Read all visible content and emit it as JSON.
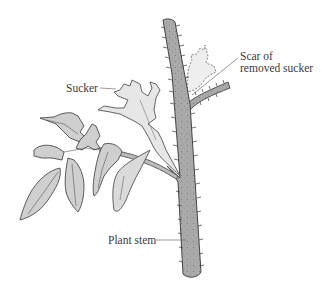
{
  "diagram": {
    "labels": {
      "scar_line1": "Scar of",
      "scar_line2": "removed sucker",
      "sucker": "Sucker",
      "plant_stem": "Plant stem"
    },
    "colors": {
      "stem_fill": "#a9a9a9",
      "leaf_fill": "#cfcfcf",
      "sucker_fill": "#e6e6e6",
      "scar_fill": "#eeeeee",
      "outline": "#4a4a4a",
      "text": "#3a3a3a",
      "background": "#ffffff"
    }
  }
}
